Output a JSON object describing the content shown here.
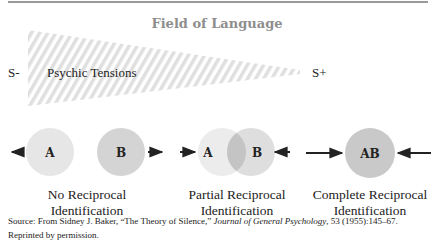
{
  "figure": {
    "title": "Field of Language",
    "s_minus": "S-",
    "s_plus": "S+",
    "wedge_label": "Psychic Tensions",
    "colors": {
      "rule": "#9a9a9a",
      "title": "#8e8e8e",
      "wedge_stripe": "#d9d9d9",
      "circle_light": "#e6e6e6",
      "circle_medium": "#d2d2d2",
      "circle_overlap": "#c4c4c4",
      "circle_dark": "#c8c8c8",
      "text": "#222222"
    },
    "panels": [
      {
        "id": "no-reciprocal",
        "circles": [
          "A",
          "B"
        ],
        "caption_line1": "No Reciprocal",
        "caption_line2": "Identification",
        "arrows": "outward"
      },
      {
        "id": "partial-reciprocal",
        "circles": [
          "A",
          "B"
        ],
        "caption_line1": "Partial Reciprocal",
        "caption_line2": "Identification",
        "arrows": "inward-short"
      },
      {
        "id": "complete-reciprocal",
        "circles": [
          "AB"
        ],
        "caption_line1": "Complete Reciprocal",
        "caption_line2": "Identification",
        "arrows": "inward-long"
      }
    ],
    "letters": {
      "a": "A",
      "b": "B",
      "ab": "AB"
    }
  },
  "source": {
    "prefix": "Source: From Sidney J. Baker, “The Theory of Silence,” ",
    "journal": "Journal of General Psychology",
    "suffix": ", 53 (1955):145–67. Reprinted by permission."
  }
}
